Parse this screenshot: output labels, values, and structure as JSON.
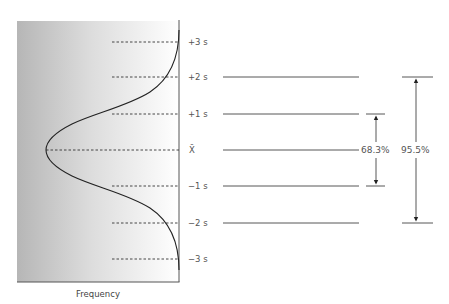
{
  "diagram": {
    "title": "",
    "x_axis_label": "Frequency",
    "levels": [
      {
        "key": "p3",
        "label": "+3 s",
        "y": 42
      },
      {
        "key": "p2",
        "label": "+2 s",
        "y": 77
      },
      {
        "key": "p1",
        "label": "+1 s",
        "y": 114
      },
      {
        "key": "mean",
        "label": "X̄",
        "y": 150
      },
      {
        "key": "m1",
        "label": "−1 s",
        "y": 186
      },
      {
        "key": "m2",
        "label": "−2 s",
        "y": 223
      },
      {
        "key": "m3",
        "label": "−3 s",
        "y": 259
      }
    ],
    "ranges": [
      {
        "label": "68.3%",
        "from": "−1 s",
        "to": "+1 s"
      },
      {
        "label": "95.5%",
        "from": "−2 s",
        "to": "+2 s"
      }
    ],
    "colors": {
      "gradient_dark": "#b4b4b4",
      "gradient_light": "#ffffff",
      "line": "#333333",
      "text": "#555555"
    }
  }
}
